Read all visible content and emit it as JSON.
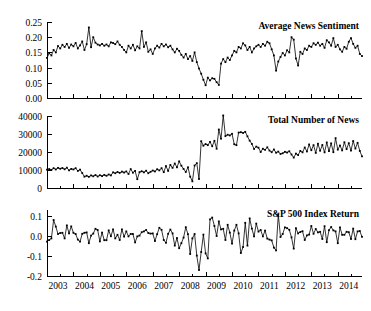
{
  "figure": {
    "background": "#ffffff",
    "line_color": "#000000",
    "marker_color": "#000000",
    "x_tick_labels": [
      "2003",
      "2004",
      "2005",
      "2006",
      "2007",
      "2008",
      "2009",
      "2010",
      "2011",
      "2012",
      "2013",
      "2014"
    ]
  },
  "chart_data": [
    {
      "type": "line",
      "title": "Average News Sentiment",
      "xlabel": "",
      "ylabel": "",
      "ylim": [
        0.0,
        0.25
      ],
      "yticks": [
        0.0,
        0.05,
        0.1,
        0.15,
        0.2,
        0.25
      ],
      "ytick_labels": [
        "0.00",
        "0.05",
        "0.10",
        "0.15",
        "0.20",
        "0.25"
      ],
      "xlim": [
        2003.0,
        2014.92
      ],
      "xticks": [
        2003,
        2004,
        2005,
        2006,
        2007,
        2008,
        2009,
        2010,
        2011,
        2012,
        2013,
        2014
      ],
      "grid": false,
      "legend": "none",
      "marker": "square",
      "x": [
        2003.0,
        2003.083,
        2003.167,
        2003.25,
        2003.333,
        2003.417,
        2003.5,
        2003.583,
        2003.667,
        2003.75,
        2003.833,
        2003.917,
        2004.0,
        2004.083,
        2004.167,
        2004.25,
        2004.333,
        2004.417,
        2004.5,
        2004.583,
        2004.667,
        2004.75,
        2004.833,
        2004.917,
        2005.0,
        2005.083,
        2005.167,
        2005.25,
        2005.333,
        2005.417,
        2005.5,
        2005.583,
        2005.667,
        2005.75,
        2005.833,
        2005.917,
        2006.0,
        2006.083,
        2006.167,
        2006.25,
        2006.333,
        2006.417,
        2006.5,
        2006.583,
        2006.667,
        2006.75,
        2006.833,
        2006.917,
        2007.0,
        2007.083,
        2007.167,
        2007.25,
        2007.333,
        2007.417,
        2007.5,
        2007.583,
        2007.667,
        2007.75,
        2007.833,
        2007.917,
        2008.0,
        2008.083,
        2008.167,
        2008.25,
        2008.333,
        2008.417,
        2008.5,
        2008.583,
        2008.667,
        2008.75,
        2008.833,
        2008.917,
        2009.0,
        2009.083,
        2009.167,
        2009.25,
        2009.333,
        2009.417,
        2009.5,
        2009.583,
        2009.667,
        2009.75,
        2009.833,
        2009.917,
        2010.0,
        2010.083,
        2010.167,
        2010.25,
        2010.333,
        2010.417,
        2010.5,
        2010.583,
        2010.667,
        2010.75,
        2010.833,
        2010.917,
        2011.0,
        2011.083,
        2011.167,
        2011.25,
        2011.333,
        2011.417,
        2011.5,
        2011.583,
        2011.667,
        2011.75,
        2011.833,
        2011.917,
        2012.0,
        2012.083,
        2012.167,
        2012.25,
        2012.333,
        2012.417,
        2012.5,
        2012.583,
        2012.667,
        2012.75,
        2012.833,
        2012.917,
        2013.0,
        2013.083,
        2013.167,
        2013.25,
        2013.333,
        2013.417,
        2013.5,
        2013.583,
        2013.667,
        2013.75,
        2013.833,
        2013.917,
        2014.0,
        2014.083,
        2014.167,
        2014.25,
        2014.333,
        2014.417,
        2014.5,
        2014.583,
        2014.667,
        2014.75,
        2014.833,
        2014.917
      ],
      "values": [
        0.132,
        0.147,
        0.14,
        0.158,
        0.15,
        0.171,
        0.163,
        0.175,
        0.168,
        0.178,
        0.165,
        0.176,
        0.17,
        0.181,
        0.163,
        0.173,
        0.186,
        0.158,
        0.177,
        0.232,
        0.167,
        0.2,
        0.182,
        0.176,
        0.173,
        0.178,
        0.172,
        0.176,
        0.17,
        0.183,
        0.181,
        0.177,
        0.186,
        0.175,
        0.168,
        0.158,
        0.15,
        0.172,
        0.163,
        0.175,
        0.157,
        0.17,
        0.163,
        0.22,
        0.168,
        0.183,
        0.152,
        0.16,
        0.145,
        0.163,
        0.172,
        0.166,
        0.178,
        0.17,
        0.176,
        0.167,
        0.172,
        0.16,
        0.15,
        0.162,
        0.155,
        0.142,
        0.133,
        0.145,
        0.128,
        0.138,
        0.122,
        0.15,
        0.118,
        0.097,
        0.08,
        0.06,
        0.042,
        0.067,
        0.058,
        0.065,
        0.063,
        0.052,
        0.043,
        0.113,
        0.128,
        0.118,
        0.133,
        0.125,
        0.14,
        0.155,
        0.15,
        0.168,
        0.163,
        0.18,
        0.173,
        0.158,
        0.168,
        0.15,
        0.163,
        0.17,
        0.175,
        0.168,
        0.178,
        0.172,
        0.185,
        0.18,
        0.16,
        0.14,
        0.09,
        0.12,
        0.135,
        0.148,
        0.14,
        0.157,
        0.15,
        0.2,
        0.192,
        0.13,
        0.107,
        0.152,
        0.145,
        0.163,
        0.158,
        0.172,
        0.168,
        0.18,
        0.175,
        0.182,
        0.172,
        0.178,
        0.165,
        0.19,
        0.183,
        0.172,
        0.197,
        0.168,
        0.175,
        0.16,
        0.152,
        0.168,
        0.162,
        0.185,
        0.197,
        0.178,
        0.165,
        0.172,
        0.145,
        0.138
      ]
    },
    {
      "type": "line",
      "title": "Total Number of News",
      "xlabel": "",
      "ylabel": "",
      "ylim": [
        0,
        40000
      ],
      "yticks": [
        0,
        10000,
        20000,
        30000,
        40000
      ],
      "ytick_labels": [
        "0",
        "10000",
        "20000",
        "30000",
        "40000"
      ],
      "xlim": [
        2003.0,
        2014.92
      ],
      "xticks": [
        2003,
        2004,
        2005,
        2006,
        2007,
        2008,
        2009,
        2010,
        2011,
        2012,
        2013,
        2014
      ],
      "grid": false,
      "legend": "none",
      "marker": "square",
      "values": [
        10200,
        10500,
        10100,
        11000,
        10300,
        11200,
        10700,
        11100,
        10400,
        11300,
        9800,
        10600,
        10300,
        11000,
        9500,
        10200,
        8300,
        6300,
        6800,
        6200,
        7000,
        6500,
        7200,
        6400,
        7100,
        6600,
        7300,
        6800,
        7500,
        7000,
        8700,
        8200,
        8900,
        8400,
        9100,
        8600,
        9200,
        7800,
        10500,
        8500,
        9500,
        4900,
        8800,
        9300,
        8700,
        9600,
        8200,
        9000,
        9700,
        9200,
        10400,
        9800,
        11000,
        8800,
        12200,
        9500,
        12800,
        11200,
        13600,
        11500,
        14800,
        12400,
        10600,
        8900,
        11500,
        6300,
        3700,
        12500,
        13800,
        5000,
        26000,
        23500,
        24400,
        23800,
        25600,
        23200,
        26200,
        21800,
        32500,
        27400,
        40300,
        28800,
        29600,
        29200,
        30100,
        24300,
        23800,
        30800,
        31000,
        30600,
        31200,
        28700,
        26300,
        24500,
        21700,
        23000,
        22400,
        20000,
        21800,
        21200,
        22600,
        20800,
        19900,
        21400,
        19600,
        20200,
        18900,
        19300,
        20100,
        19700,
        20400,
        18600,
        16900,
        19100,
        18300,
        20600,
        19800,
        22500,
        20300,
        24200,
        21000,
        23800,
        19500,
        24600,
        20700,
        23900,
        19800,
        25300,
        20500,
        24800,
        19900,
        27700,
        21300,
        23600,
        20900,
        25400,
        21600,
        24900,
        20800,
        26100,
        21900,
        25100,
        20600,
        17600
      ]
    },
    {
      "type": "line",
      "title": "S&P 500 Index Return",
      "xlabel": "",
      "ylabel": "",
      "ylim": [
        -0.2,
        0.13
      ],
      "yticks": [
        -0.2,
        -0.1,
        0.0,
        0.1
      ],
      "ytick_labels": [
        "-0.2",
        "-0.1",
        "0.0",
        "0.1"
      ],
      "xlim": [
        2003.0,
        2014.92
      ],
      "xticks": [
        2003,
        2004,
        2005,
        2006,
        2007,
        2008,
        2009,
        2010,
        2011,
        2012,
        2013,
        2014
      ],
      "grid": false,
      "legend": "none",
      "marker": "square",
      "values": [
        -0.028,
        -0.02,
        -0.012,
        0.08,
        0.047,
        0.01,
        0.015,
        0.016,
        -0.012,
        0.053,
        0.013,
        0.048,
        0.016,
        0.01,
        -0.018,
        -0.028,
        0.011,
        0.016,
        0.018,
        -0.036,
        0.002,
        0.012,
        0.036,
        0.03,
        -0.027,
        0.017,
        -0.021,
        -0.021,
        0.028,
        -0.001,
        0.033,
        -0.012,
        0.006,
        -0.02,
        0.033,
        -0.003,
        0.023,
        -0.002,
        0.01,
        0.01,
        -0.032,
        -0.002,
        0.002,
        0.019,
        0.023,
        0.03,
        0.015,
        0.012,
        0.013,
        -0.025,
        0.009,
        0.041,
        0.031,
        -0.02,
        -0.034,
        0.011,
        0.032,
        0.013,
        -0.048,
        -0.01,
        -0.061,
        -0.036,
        -0.008,
        0.044,
        0.009,
        -0.09,
        -0.012,
        0.01,
        -0.098,
        -0.17,
        -0.08,
        0.007,
        -0.087,
        -0.112,
        0.083,
        0.092,
        0.05,
        0.0,
        0.073,
        0.033,
        0.036,
        -0.02,
        0.056,
        0.017,
        -0.038,
        0.027,
        0.056,
        0.013,
        -0.085,
        -0.055,
        0.066,
        -0.048,
        0.088,
        0.037,
        -0.002,
        0.062,
        0.022,
        0.03,
        -0.002,
        0.027,
        -0.013,
        -0.018,
        -0.022,
        -0.058,
        -0.072,
        0.107,
        -0.005,
        0.01,
        0.043,
        0.039,
        0.031,
        -0.007,
        -0.063,
        0.039,
        0.013,
        0.02,
        0.024,
        -0.02,
        0.003,
        0.007,
        0.05,
        0.011,
        0.035,
        0.018,
        0.021,
        -0.015,
        0.049,
        -0.031,
        0.029,
        0.045,
        0.028,
        0.023,
        -0.036,
        0.043,
        0.006,
        0.006,
        0.021,
        0.019,
        -0.015,
        0.037,
        -0.016,
        0.023,
        0.025,
        -0.004
      ]
    }
  ]
}
